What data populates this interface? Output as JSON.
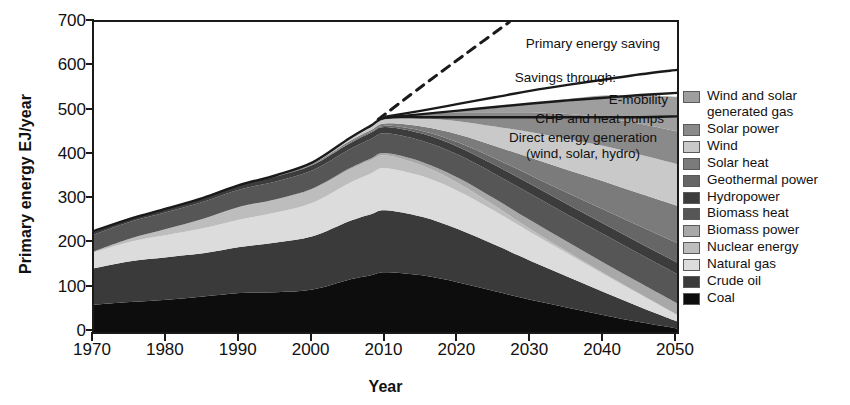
{
  "axes": {
    "ylabel": "Primary energy EJ/year",
    "xlabel": "Year",
    "yticks": [
      "0",
      "100",
      "200",
      "300",
      "400",
      "500",
      "600",
      "700"
    ],
    "xticks": [
      "1970",
      "1980",
      "1990",
      "2000",
      "2010",
      "2020",
      "2030",
      "2040",
      "2050"
    ]
  },
  "annotations": {
    "primary_saving": "Primary energy saving",
    "savings_through": "Savings through:",
    "emobility": "E-mobility",
    "chp": "CHP and heat pumps",
    "direct_line1": "Direct energy generation",
    "direct_line2": "(wind, solar, hydro)"
  },
  "legend": {
    "items": [
      {
        "label": "Wind and solar generated gas",
        "color": "#9e9e9e"
      },
      {
        "label": "Solar power",
        "color": "#8a8a8a"
      },
      {
        "label": "Wind",
        "color": "#c9c9c9"
      },
      {
        "label": "Solar heat",
        "color": "#7b7b7b"
      },
      {
        "label": "Geothermal power",
        "color": "#666666"
      },
      {
        "label": "Hydropower",
        "color": "#3c3c3c"
      },
      {
        "label": "Biomass heat",
        "color": "#565656"
      },
      {
        "label": "Biomass power",
        "color": "#a8a8a8"
      },
      {
        "label": "Nuclear energy",
        "color": "#bdbdbd"
      },
      {
        "label": "Natural gas",
        "color": "#dcdcdc"
      },
      {
        "label": "Crude oil",
        "color": "#3a3a3a"
      },
      {
        "label": "Coal",
        "color": "#0d0d0d"
      }
    ]
  },
  "chart_data": {
    "type": "area",
    "title": "",
    "xlabel": "Year",
    "ylabel": "Primary energy EJ/year",
    "xlim": [
      1970,
      2050
    ],
    "ylim": [
      0,
      700
    ],
    "grid": false,
    "legend_position": "right",
    "stack_order_bottom_to_top": [
      "Coal",
      "Crude oil",
      "Natural gas",
      "Nuclear energy",
      "Biomass power",
      "Biomass heat",
      "Hydropower",
      "Geothermal power",
      "Solar heat",
      "Wind",
      "Solar power",
      "Wind and solar generated gas"
    ],
    "x": [
      1970,
      1975,
      1980,
      1985,
      1990,
      1995,
      2000,
      2005,
      2008,
      2010,
      2015,
      2020,
      2025,
      2030,
      2035,
      2040,
      2045,
      2050
    ],
    "series": [
      {
        "name": "Coal",
        "color": "#0d0d0d",
        "values": [
          62,
          68,
          73,
          80,
          88,
          90,
          96,
          118,
          128,
          135,
          128,
          112,
          92,
          72,
          55,
          38,
          22,
          8
        ]
      },
      {
        "name": "Crude oil",
        "color": "#3a3a3a",
        "values": [
          82,
          92,
          96,
          98,
          104,
          112,
          120,
          132,
          138,
          140,
          132,
          120,
          105,
          88,
          70,
          52,
          34,
          16
        ]
      },
      {
        "name": "Natural gas",
        "color": "#dcdcdc",
        "values": [
          36,
          44,
          50,
          56,
          62,
          68,
          76,
          86,
          92,
          95,
          92,
          86,
          76,
          64,
          52,
          40,
          28,
          15
        ]
      },
      {
        "name": "Nuclear energy",
        "color": "#bdbdbd",
        "values": [
          2,
          7,
          14,
          22,
          28,
          29,
          30,
          30,
          30,
          29,
          24,
          18,
          12,
          7,
          4,
          2,
          1,
          0
        ]
      },
      {
        "name": "Biomass power",
        "color": "#a8a8a8",
        "values": [
          0,
          0,
          0,
          0,
          1,
          1,
          2,
          3,
          4,
          5,
          8,
          12,
          16,
          20,
          22,
          24,
          25,
          26
        ]
      },
      {
        "name": "Biomass heat",
        "color": "#565656",
        "values": [
          38,
          38,
          38,
          38,
          39,
          40,
          41,
          43,
          44,
          45,
          48,
          52,
          56,
          60,
          62,
          64,
          65,
          66
        ]
      },
      {
        "name": "Hydropower",
        "color": "#3c3c3c",
        "values": [
          6,
          7,
          8,
          9,
          10,
          11,
          12,
          13,
          14,
          14,
          16,
          18,
          20,
          22,
          23,
          24,
          25,
          26
        ]
      },
      {
        "name": "Geothermal power",
        "color": "#666666",
        "values": [
          0,
          0,
          0,
          0,
          0,
          1,
          1,
          2,
          2,
          3,
          6,
          10,
          15,
          20,
          26,
          32,
          38,
          44
        ]
      },
      {
        "name": "Solar heat",
        "color": "#7b7b7b",
        "values": [
          0,
          0,
          0,
          0,
          0,
          1,
          2,
          3,
          4,
          5,
          10,
          18,
          28,
          40,
          52,
          64,
          74,
          84
        ]
      },
      {
        "name": "Wind",
        "color": "#c9c9c9",
        "values": [
          0,
          0,
          0,
          0,
          0,
          1,
          2,
          5,
          7,
          9,
          18,
          30,
          44,
          58,
          70,
          80,
          88,
          94
        ]
      },
      {
        "name": "Solar power",
        "color": "#8a8a8a",
        "values": [
          0,
          0,
          0,
          0,
          0,
          0,
          1,
          2,
          3,
          4,
          10,
          20,
          32,
          45,
          56,
          64,
          70,
          74
        ]
      },
      {
        "name": "Wind and solar generated gas",
        "color": "#9e9e9e",
        "values": [
          0,
          0,
          0,
          0,
          0,
          0,
          0,
          0,
          0,
          0,
          1,
          4,
          10,
          20,
          34,
          50,
          64,
          78
        ]
      }
    ],
    "lines": [
      {
        "name": "Direct energy generation top (total primary energy)",
        "x": [
          1970,
          1975,
          1980,
          1985,
          1990,
          1995,
          2000,
          2005,
          2008,
          2010,
          2015,
          2020,
          2025,
          2030,
          2035,
          2040,
          2045,
          2050
        ],
        "y": [
          228,
          256,
          279,
          303,
          332,
          354,
          383,
          437,
          466,
          484,
          485,
          485,
          485,
          485,
          485,
          485,
          485,
          487
        ],
        "style": "solid"
      },
      {
        "name": "CHP and heat pumps savings boundary",
        "x": [
          2010,
          2015,
          2020,
          2025,
          2030,
          2035,
          2040,
          2045,
          2050
        ],
        "y": [
          484,
          492,
          500,
          508,
          516,
          523,
          529,
          535,
          540
        ],
        "style": "solid"
      },
      {
        "name": "E-mobility savings boundary (upper)",
        "x": [
          2010,
          2015,
          2020,
          2025,
          2030,
          2035,
          2040,
          2045,
          2050
        ],
        "y": [
          486,
          500,
          515,
          530,
          545,
          558,
          570,
          582,
          592
        ],
        "style": "solid"
      },
      {
        "name": "Business as usual projection",
        "x": [
          2009,
          2015,
          2021,
          2027
        ],
        "y": [
          480,
          555,
          628,
          700
        ],
        "style": "dashed"
      }
    ]
  }
}
